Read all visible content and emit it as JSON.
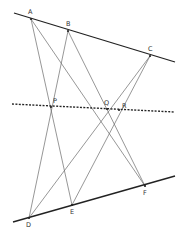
{
  "diagram": {
    "type": "geometry",
    "title": "",
    "colors": {
      "background": "#ffffff",
      "main_line": "#222222",
      "construction_line": "#6a6a6a",
      "dotted_line": "#222222",
      "label": "#333333"
    },
    "points": {
      "A": {
        "label": "A",
        "x": 31,
        "y": 19,
        "lx": 28,
        "ly": 14
      },
      "B": {
        "label": "B",
        "x": 68,
        "y": 31,
        "lx": 66,
        "ly": 26
      },
      "C": {
        "label": "C",
        "x": 150,
        "y": 56,
        "lx": 148,
        "ly": 51
      },
      "D": {
        "label": "D",
        "x": 29,
        "y": 218,
        "lx": 26,
        "ly": 227
      },
      "E": {
        "label": "E",
        "x": 72,
        "y": 205,
        "lx": 70,
        "ly": 214
      },
      "F": {
        "label": "F",
        "x": 145,
        "y": 186,
        "lx": 143,
        "ly": 195
      },
      "P": {
        "label": "P",
        "x": 51,
        "y": 107,
        "lx": 53,
        "ly": 103
      },
      "Q": {
        "label": "Q",
        "x": 107,
        "y": 109,
        "lx": 104,
        "ly": 105
      },
      "R": {
        "label": "R",
        "x": 119,
        "y": 110,
        "lx": 122,
        "ly": 108
      }
    },
    "lines": {
      "top_line": {
        "x1": 14,
        "y1": 13,
        "x2": 175,
        "y2": 62,
        "style": "solid-thick"
      },
      "bottom_line": {
        "x1": 13,
        "y1": 222,
        "x2": 175,
        "y2": 176,
        "style": "solid-thick"
      },
      "pappus_line": {
        "x1": 12,
        "y1": 104,
        "x2": 175,
        "y2": 112,
        "style": "dotted"
      }
    },
    "segments": [
      {
        "from": "A",
        "to": "E"
      },
      {
        "from": "A",
        "to": "F"
      },
      {
        "from": "B",
        "to": "D"
      },
      {
        "from": "B",
        "to": "F"
      },
      {
        "from": "C",
        "to": "D"
      },
      {
        "from": "C",
        "to": "E"
      }
    ],
    "intersections": [
      {
        "point": "P",
        "of": [
          "AE",
          "BD"
        ]
      },
      {
        "point": "Q",
        "of": [
          "AF",
          "CD"
        ]
      },
      {
        "point": "R",
        "of": [
          "BF",
          "CE"
        ]
      }
    ]
  }
}
